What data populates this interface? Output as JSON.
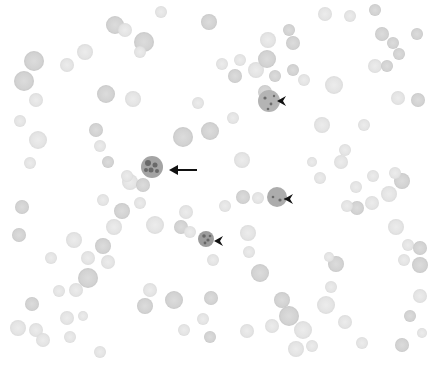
{
  "image": {
    "description": "Grayscale light micrograph of a blood smear showing scattered erythrocytes; one heavily stained cell is indicated by an arrow and three stained cells by arrowheads",
    "width": 444,
    "height": 365,
    "background": "#ffffff",
    "field_right_edge": 428
  },
  "colors": {
    "cell_light": "#e6e6e6",
    "cell_mid": "#d6d6d6",
    "cell_dark": "#c4c4c4",
    "infected_fill": "#a9a9a9",
    "infected_spot": "#5a5a5a",
    "marker": "#111111"
  },
  "annotations": [
    {
      "type": "arrow",
      "icon": "arrow-left-icon",
      "tip": [
        169,
        170
      ],
      "tail": [
        197,
        170
      ],
      "target_cell": [
        152,
        167,
        11
      ]
    },
    {
      "type": "arrowhead",
      "icon": "arrowhead-left-icon",
      "tip": [
        277,
        101
      ],
      "target_cell": [
        269,
        101,
        11
      ]
    },
    {
      "type": "arrowhead",
      "icon": "arrowhead-left-icon",
      "tip": [
        284,
        199
      ],
      "target_cell": [
        277,
        197,
        10
      ]
    },
    {
      "type": "arrowhead",
      "icon": "arrowhead-left-icon",
      "tip": [
        214,
        241
      ],
      "target_cell": [
        206,
        239,
        8
      ]
    }
  ],
  "cells": [
    [
      115,
      25,
      9,
      "m"
    ],
    [
      125,
      30,
      7,
      "l"
    ],
    [
      144,
      42,
      10,
      "m"
    ],
    [
      85,
      52,
      8,
      "l"
    ],
    [
      34,
      61,
      10,
      "m"
    ],
    [
      67,
      65,
      7,
      "l"
    ],
    [
      24,
      81,
      10,
      "m"
    ],
    [
      140,
      52,
      6,
      "l"
    ],
    [
      106,
      94,
      9,
      "m"
    ],
    [
      133,
      99,
      8,
      "l"
    ],
    [
      36,
      100,
      7,
      "l"
    ],
    [
      161,
      12,
      6,
      "l"
    ],
    [
      209,
      22,
      8,
      "m"
    ],
    [
      20,
      121,
      6,
      "l"
    ],
    [
      38,
      140,
      9,
      "l"
    ],
    [
      96,
      130,
      7,
      "m"
    ],
    [
      100,
      146,
      6,
      "l"
    ],
    [
      108,
      162,
      6,
      "m"
    ],
    [
      183,
      137,
      10,
      "m"
    ],
    [
      210,
      131,
      9,
      "m"
    ],
    [
      198,
      103,
      6,
      "l"
    ],
    [
      30,
      163,
      6,
      "l"
    ],
    [
      130,
      182,
      8,
      "l"
    ],
    [
      127,
      176,
      6,
      "l"
    ],
    [
      143,
      185,
      7,
      "m"
    ],
    [
      222,
      64,
      6,
      "l"
    ],
    [
      240,
      60,
      6,
      "l"
    ],
    [
      235,
      76,
      7,
      "m"
    ],
    [
      275,
      76,
      6,
      "m"
    ],
    [
      256,
      70,
      8,
      "l"
    ],
    [
      265,
      92,
      7,
      "m"
    ],
    [
      267,
      59,
      9,
      "m"
    ],
    [
      293,
      70,
      6,
      "m"
    ],
    [
      304,
      80,
      6,
      "l"
    ],
    [
      293,
      43,
      7,
      "m"
    ],
    [
      289,
      30,
      6,
      "m"
    ],
    [
      268,
      40,
      8,
      "l"
    ],
    [
      325,
      14,
      7,
      "l"
    ],
    [
      350,
      16,
      6,
      "l"
    ],
    [
      334,
      85,
      9,
      "l"
    ],
    [
      322,
      125,
      8,
      "l"
    ],
    [
      364,
      125,
      6,
      "l"
    ],
    [
      345,
      150,
      6,
      "l"
    ],
    [
      341,
      162,
      7,
      "l"
    ],
    [
      375,
      10,
      6,
      "m"
    ],
    [
      382,
      34,
      7,
      "m"
    ],
    [
      393,
      43,
      6,
      "m"
    ],
    [
      375,
      66,
      7,
      "l"
    ],
    [
      387,
      66,
      6,
      "m"
    ],
    [
      399,
      54,
      6,
      "m"
    ],
    [
      417,
      34,
      6,
      "m"
    ],
    [
      398,
      98,
      7,
      "l"
    ],
    [
      418,
      100,
      7,
      "m"
    ],
    [
      242,
      160,
      8,
      "l"
    ],
    [
      233,
      118,
      6,
      "l"
    ],
    [
      320,
      178,
      6,
      "l"
    ],
    [
      312,
      162,
      5,
      "l"
    ],
    [
      22,
      207,
      7,
      "m"
    ],
    [
      19,
      235,
      7,
      "m"
    ],
    [
      103,
      200,
      6,
      "l"
    ],
    [
      74,
      240,
      8,
      "l"
    ],
    [
      88,
      258,
      7,
      "l"
    ],
    [
      103,
      246,
      8,
      "m"
    ],
    [
      108,
      262,
      7,
      "l"
    ],
    [
      51,
      258,
      6,
      "l"
    ],
    [
      114,
      227,
      8,
      "l"
    ],
    [
      155,
      225,
      9,
      "l"
    ],
    [
      122,
      211,
      8,
      "m"
    ],
    [
      181,
      227,
      7,
      "m"
    ],
    [
      190,
      232,
      6,
      "l"
    ],
    [
      186,
      212,
      7,
      "l"
    ],
    [
      140,
      203,
      6,
      "l"
    ],
    [
      88,
      278,
      10,
      "m"
    ],
    [
      76,
      290,
      7,
      "l"
    ],
    [
      150,
      290,
      7,
      "l"
    ],
    [
      145,
      306,
      8,
      "m"
    ],
    [
      174,
      300,
      9,
      "m"
    ],
    [
      32,
      304,
      7,
      "m"
    ],
    [
      18,
      328,
      8,
      "l"
    ],
    [
      36,
      330,
      7,
      "l"
    ],
    [
      43,
      340,
      7,
      "l"
    ],
    [
      70,
      337,
      6,
      "l"
    ],
    [
      67,
      318,
      7,
      "l"
    ],
    [
      59,
      291,
      6,
      "l"
    ],
    [
      83,
      316,
      5,
      "l"
    ],
    [
      211,
      298,
      7,
      "m"
    ],
    [
      203,
      319,
      6,
      "l"
    ],
    [
      210,
      337,
      6,
      "m"
    ],
    [
      184,
      330,
      6,
      "l"
    ],
    [
      213,
      260,
      6,
      "l"
    ],
    [
      100,
      352,
      6,
      "l"
    ],
    [
      243,
      197,
      7,
      "m"
    ],
    [
      258,
      198,
      6,
      "l"
    ],
    [
      225,
      206,
      6,
      "l"
    ],
    [
      248,
      233,
      8,
      "l"
    ],
    [
      249,
      252,
      6,
      "l"
    ],
    [
      260,
      273,
      9,
      "m"
    ],
    [
      282,
      300,
      8,
      "m"
    ],
    [
      289,
      316,
      10,
      "m"
    ],
    [
      272,
      326,
      7,
      "l"
    ],
    [
      247,
      331,
      7,
      "l"
    ],
    [
      303,
      330,
      9,
      "l"
    ],
    [
      312,
      346,
      6,
      "l"
    ],
    [
      296,
      349,
      8,
      "l"
    ],
    [
      326,
      305,
      9,
      "l"
    ],
    [
      336,
      264,
      8,
      "m"
    ],
    [
      329,
      257,
      5,
      "l"
    ],
    [
      331,
      287,
      6,
      "l"
    ],
    [
      345,
      322,
      7,
      "l"
    ],
    [
      357,
      208,
      7,
      "m"
    ],
    [
      347,
      206,
      6,
      "l"
    ],
    [
      372,
      203,
      7,
      "l"
    ],
    [
      356,
      187,
      6,
      "l"
    ],
    [
      373,
      176,
      6,
      "l"
    ],
    [
      396,
      227,
      8,
      "l"
    ],
    [
      408,
      245,
      6,
      "l"
    ],
    [
      420,
      248,
      7,
      "m"
    ],
    [
      420,
      265,
      8,
      "m"
    ],
    [
      404,
      260,
      6,
      "l"
    ],
    [
      420,
      296,
      7,
      "l"
    ],
    [
      410,
      316,
      6,
      "m"
    ],
    [
      402,
      345,
      7,
      "m"
    ],
    [
      362,
      343,
      6,
      "l"
    ],
    [
      389,
      194,
      8,
      "l"
    ],
    [
      402,
      181,
      8,
      "m"
    ],
    [
      395,
      173,
      6,
      "l"
    ],
    [
      422,
      333,
      5,
      "l"
    ]
  ],
  "infected_cells": [
    {
      "cx": 152,
      "cy": 167,
      "r": 11,
      "fill": "#a4a4a4",
      "spots": [
        [
          148,
          163,
          3
        ],
        [
          155,
          165,
          2.5
        ],
        [
          151,
          170,
          2.5
        ],
        [
          157,
          171,
          2
        ],
        [
          146,
          170,
          2
        ]
      ]
    },
    {
      "cx": 269,
      "cy": 101,
      "r": 11,
      "fill": "#b4b4b4",
      "spots": [
        [
          265,
          98,
          1.6
        ],
        [
          271,
          104,
          1.4
        ],
        [
          268,
          109,
          1.3
        ],
        [
          274,
          96,
          1.2
        ]
      ]
    },
    {
      "cx": 277,
      "cy": 197,
      "r": 10,
      "fill": "#acacac",
      "spots": [
        [
          280,
          200,
          1.6
        ],
        [
          273,
          197,
          1.3
        ],
        [
          285,
          199,
          1.2
        ]
      ]
    },
    {
      "cx": 206,
      "cy": 239,
      "r": 8,
      "fill": "#9c9c9c",
      "spots": [
        [
          204,
          236,
          1.8
        ],
        [
          208,
          240,
          1.6
        ],
        [
          205,
          243,
          1.4
        ],
        [
          210,
          236,
          1.3
        ]
      ]
    }
  ]
}
